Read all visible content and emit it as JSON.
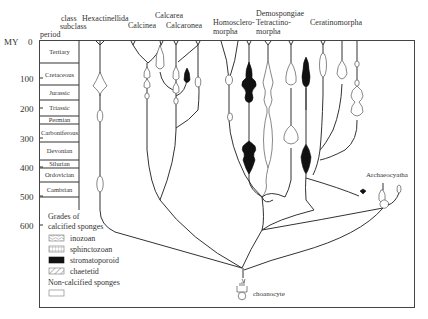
{
  "axis": {
    "label": "MY",
    "ticks": [
      "0",
      "100",
      "200",
      "300",
      "400",
      "500",
      "600"
    ],
    "tick_values": [
      0,
      100,
      200,
      300,
      400,
      500,
      600
    ]
  },
  "header": {
    "class_label": "class",
    "subclass_label": "subclass",
    "period_label": "period"
  },
  "periods": [
    {
      "name": "Tertiary",
      "start": 0,
      "end": 66
    },
    {
      "name": "Cretaceous",
      "start": 66,
      "end": 145
    },
    {
      "name": "Jurassic",
      "start": 145,
      "end": 201
    },
    {
      "name": "Triassic",
      "start": 201,
      "end": 252
    },
    {
      "name": "Permian",
      "start": 252,
      "end": 299
    },
    {
      "name": "Carboniferous",
      "start": 299,
      "end": 359
    },
    {
      "name": "Devonian",
      "start": 359,
      "end": 419
    },
    {
      "name": "Silurian",
      "start": 419,
      "end": 444
    },
    {
      "name": "Ordovician",
      "start": 444,
      "end": 485
    },
    {
      "name": "Cambrian",
      "start": 485,
      "end": 541
    }
  ],
  "taxa": {
    "hexactinellida": "Hexactinellida",
    "calcarea": "Calcarea",
    "calcinea": "Calcinea",
    "calcaronea": "Calcaronea",
    "homoscleromorpha_1": "Homosclero-",
    "homoscleromorpha_2": "morpha",
    "demospongiae": "Demospongiae",
    "tetractinomorpha_1": "Tetractino-",
    "tetractinomorpha_2": "morpha",
    "ceratinomorpha": "Ceratinomorpha",
    "archaeocyatha": "Archaeocyatha",
    "choanocyte": "choanocyte"
  },
  "legend": {
    "title_1": "Grades of",
    "title_2": "calcified sponges",
    "items": [
      {
        "label": "inozoan",
        "pattern": "wavy-hatch"
      },
      {
        "label": "sphinctozoan",
        "pattern": "dotted-grid"
      },
      {
        "label": "stromatoporoid",
        "pattern": "solid-black"
      },
      {
        "label": "chaetetid",
        "pattern": "diagonal-hatch"
      }
    ],
    "non_calcified_label": "Non-calcified sponges",
    "non_calcified_pattern": "open"
  },
  "colors": {
    "line": "#333333",
    "fill_solid": "#111111",
    "background": "#ffffff"
  }
}
